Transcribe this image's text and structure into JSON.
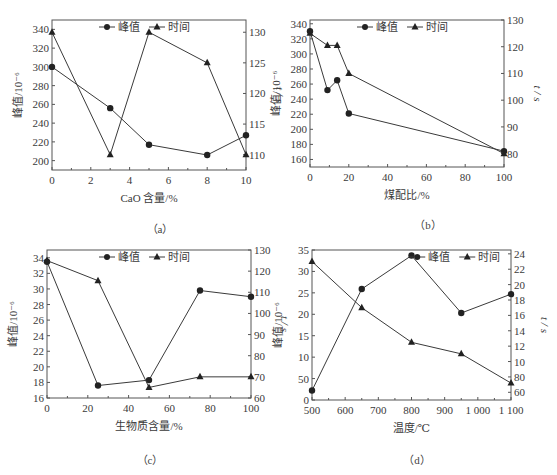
{
  "chart_data": [
    {
      "id": "a",
      "type": "line",
      "caption": "（a）",
      "xlabel": "CaO 含量/%",
      "ylabel": "峰值/10⁻⁶",
      "y2label": "t / s",
      "xlim": [
        0,
        10
      ],
      "ylim": [
        190,
        350
      ],
      "y2lim": [
        107.5,
        132
      ],
      "xticks": [
        0,
        2,
        4,
        6,
        8,
        10
      ],
      "xtick_labels": [
        "0",
        "2",
        "4",
        "6",
        "8",
        "10"
      ],
      "yticks": [
        200,
        220,
        240,
        260,
        280,
        300,
        320,
        340
      ],
      "y2ticks": [
        110,
        115,
        120,
        125,
        130
      ],
      "legend": [
        "峰值",
        "时间"
      ],
      "legend_position": "top-center",
      "series": [
        {
          "name": "峰值",
          "marker": "circle",
          "axis": "left",
          "x": [
            0,
            3,
            5,
            8,
            10
          ],
          "values": [
            300,
            256,
            217,
            206,
            227
          ]
        },
        {
          "name": "时间",
          "marker": "triangle",
          "axis": "right",
          "x": [
            0,
            3,
            5,
            8,
            10
          ],
          "values": [
            130,
            110,
            130,
            125,
            110
          ]
        }
      ]
    },
    {
      "id": "b",
      "type": "line",
      "caption": "（b）",
      "xlabel": "煤配比/%",
      "ylabel": "峰值/10⁻⁶",
      "y2label": "t / s",
      "xlim": [
        0,
        100
      ],
      "ylim": [
        150,
        345
      ],
      "y2lim": [
        75,
        130
      ],
      "xticks": [
        0,
        20,
        40,
        60,
        80,
        100
      ],
      "xtick_labels": [
        "0",
        "20",
        "40",
        "60",
        "80",
        "100"
      ],
      "yticks": [
        160,
        180,
        200,
        220,
        240,
        260,
        280,
        300,
        320,
        340
      ],
      "y2ticks": [
        80,
        90,
        100,
        110,
        120,
        130
      ],
      "legend": [
        "峰值",
        "时间"
      ],
      "legend_position": "top-center",
      "series": [
        {
          "name": "峰值",
          "marker": "circle",
          "axis": "left",
          "x": [
            0,
            9,
            14,
            20,
            100
          ],
          "values": [
            330,
            252,
            265,
            221,
            171
          ]
        },
        {
          "name": "时间",
          "marker": "triangle",
          "axis": "right",
          "x": [
            0,
            9,
            14,
            20,
            100
          ],
          "values": [
            125,
            120.5,
            120.5,
            110,
            80
          ]
        }
      ]
    },
    {
      "id": "c",
      "type": "line",
      "caption": "（c）",
      "xlabel": "生物质含量/%",
      "ylabel": "峰值/10⁻⁶",
      "y2label": "t / s",
      "xlim": [
        0,
        100
      ],
      "ylim": [
        16,
        35
      ],
      "y2lim": [
        60,
        130
      ],
      "xticks": [
        0,
        20,
        40,
        60,
        80,
        100
      ],
      "xtick_labels": [
        "0",
        "20",
        "40",
        "60",
        "80",
        "100"
      ],
      "yticks": [
        16,
        18,
        20,
        22,
        24,
        26,
        28,
        30,
        32,
        34
      ],
      "y2ticks": [
        60,
        70,
        80,
        90,
        100,
        110,
        120,
        130
      ],
      "legend": [
        "峰值",
        "时间"
      ],
      "legend_position": "top-center",
      "series": [
        {
          "name": "峰值",
          "marker": "circle",
          "axis": "left",
          "x": [
            0,
            25,
            50,
            75,
            100
          ],
          "values": [
            33.5,
            17.6,
            18.3,
            29.8,
            29.0
          ]
        },
        {
          "name": "时间",
          "marker": "triangle",
          "axis": "right",
          "x": [
            0,
            25,
            50,
            75,
            100
          ],
          "values": [
            125,
            115.5,
            65,
            70,
            70
          ]
        }
      ]
    },
    {
      "id": "d",
      "type": "line",
      "caption": "（d）",
      "xlabel": "温度/℃",
      "ylabel": "峰值/10⁻⁶",
      "y2label": "t / s",
      "xlim": [
        500,
        1100
      ],
      "ylim": [
        0,
        35
      ],
      "y2lim": [
        5,
        24.5
      ],
      "xticks": [
        500,
        600,
        700,
        800,
        900,
        1000,
        1100
      ],
      "xtick_labels": [
        "500",
        "600",
        "700",
        "800",
        "900",
        "1 000",
        "1 100"
      ],
      "yticks": [
        0,
        5,
        10,
        15,
        20,
        25,
        30,
        35
      ],
      "ytick_labels": [
        "0",
        "50",
        "10",
        "15",
        "20",
        "25",
        "30",
        "35"
      ],
      "y2ticks": [
        6,
        8,
        10,
        12,
        14,
        16,
        18,
        20,
        22,
        24
      ],
      "y2tick_labels": [
        "60",
        "80",
        "10",
        "12",
        "14",
        "16",
        "18",
        "20",
        "22",
        "24"
      ],
      "legend": [
        "峰值",
        "时间"
      ],
      "legend_position": "top-right",
      "series": [
        {
          "name": "峰值",
          "marker": "circle",
          "axis": "left",
          "x": [
            500,
            650,
            800,
            950,
            1100
          ],
          "values": [
            2.2,
            25.9,
            33.7,
            20.3,
            24.7
          ]
        },
        {
          "name": "时间",
          "marker": "triangle",
          "axis": "right",
          "x": [
            500,
            650,
            800,
            950,
            1100
          ],
          "values": [
            23.0,
            17.0,
            12.5,
            11.0,
            7.2
          ]
        }
      ]
    }
  ],
  "layout": {
    "panels": [
      {
        "left": 52,
        "top": 20,
        "width": 194,
        "height": 150,
        "legend_x": 0.5
      },
      {
        "left": 310,
        "top": 20,
        "width": 194,
        "height": 147,
        "legend_x": 0.5
      },
      {
        "left": 47,
        "top": 250,
        "width": 204,
        "height": 148,
        "legend_x": 0.5
      },
      {
        "left": 312,
        "top": 250,
        "width": 199,
        "height": 150,
        "legend_x": 0.74
      }
    ]
  },
  "colors": {
    "line": "#3a3a3a",
    "axis": "#555555",
    "text": "#3a3a3a"
  }
}
